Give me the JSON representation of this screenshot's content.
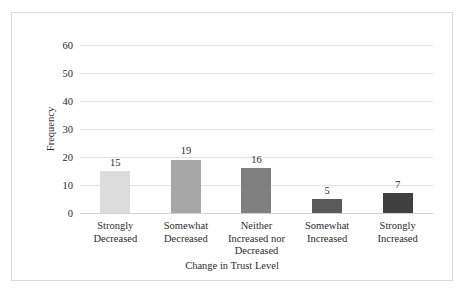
{
  "chart_data": {
    "type": "bar",
    "title": "",
    "xlabel": "Change in Trust Level",
    "ylabel": "Frequency",
    "categories": [
      "Strongly\nDecreased",
      "Somewhat\nDecreased",
      "Neither\nIncreased nor\nDecreased",
      "Somewhat\nIncreased",
      "Strongly\nIncreased"
    ],
    "category_lines": [
      [
        "Strongly",
        "Decreased"
      ],
      [
        "Somewhat",
        "Decreased"
      ],
      [
        "Neither",
        "Increased nor",
        "Decreased"
      ],
      [
        "Somewhat",
        "Increased"
      ],
      [
        "Strongly",
        "Increased"
      ]
    ],
    "values": [
      15,
      19,
      16,
      5,
      7
    ],
    "value_labels": [
      "15",
      "19",
      "16",
      "5",
      "7"
    ],
    "ylim": [
      0,
      60
    ],
    "ytick_step": 10,
    "yticks": [
      "0",
      "10",
      "20",
      "30",
      "40",
      "50",
      "60"
    ],
    "grid": true,
    "legend": false,
    "bar_colors": [
      "#dcdcdc",
      "#a6a6a6",
      "#808080",
      "#595959",
      "#404040"
    ]
  },
  "style": {
    "frame_color": "#d9d9d9",
    "gridline_color": "#e2e2e2",
    "baseline_color": "#d2d2d2",
    "text_color": "#2b2b2b",
    "background": "#ffffff"
  }
}
